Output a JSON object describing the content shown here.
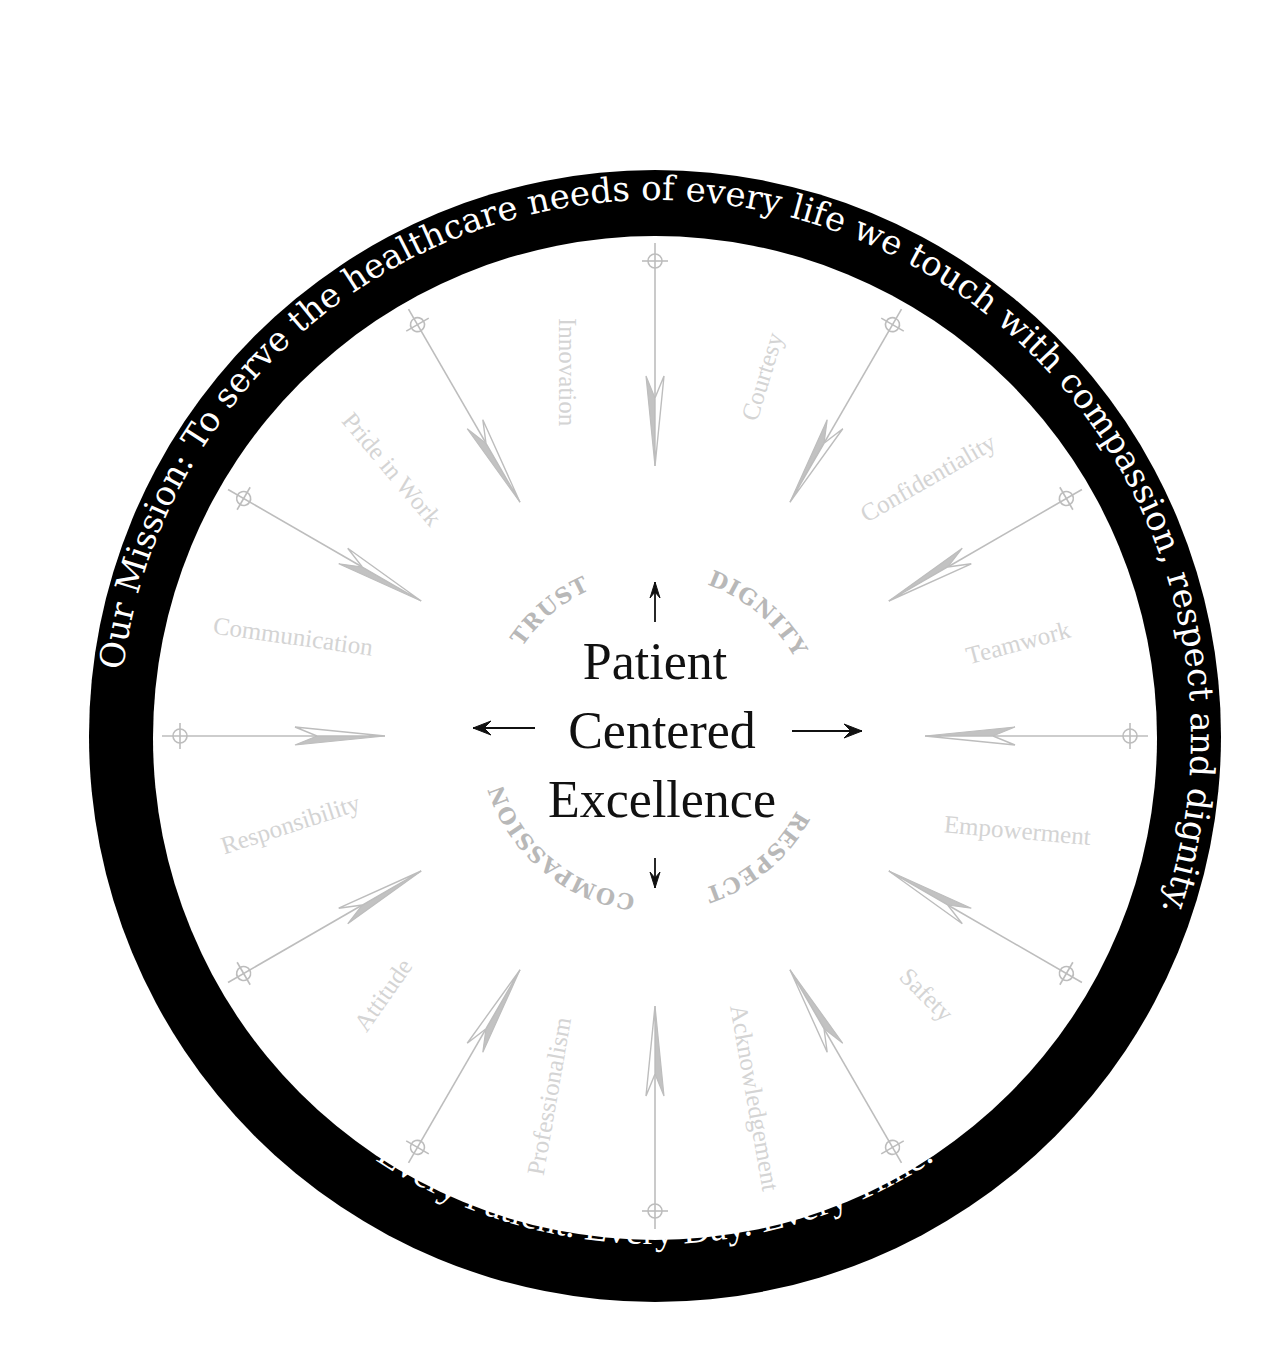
{
  "diagram": {
    "center": {
      "x": 655,
      "y": 736
    },
    "ring": {
      "outer_radius": 566,
      "inner_radius": 502,
      "color": "#000000",
      "mission_text": "Our Mission: To serve the healthcare needs of every life we touch with compassion, respect and dignity.",
      "motto_text": "Every Patient.   Every Day.   Every Time."
    },
    "center_title": {
      "lines": [
        "Patient",
        "Centered",
        "Excellence"
      ],
      "color": "#111111"
    },
    "core_values": [
      {
        "label": "TRUST",
        "angle": -40
      },
      {
        "label": "DIGNITY",
        "angle": 40
      },
      {
        "label": "RESPECT",
        "angle": 140
      },
      {
        "label": "COMPASSION",
        "angle": 220
      }
    ],
    "center_arrows": [
      "up",
      "right",
      "down",
      "left"
    ],
    "values": [
      {
        "label": "Innovation",
        "angle": -14
      },
      {
        "label": "Courtesy",
        "angle": 17
      },
      {
        "label": "Confidentiality",
        "angle": 47
      },
      {
        "label": "Teamwork",
        "angle": 76
      },
      {
        "label": "Empowerment",
        "angle": 105
      },
      {
        "label": "Safety",
        "angle": 134
      },
      {
        "label": "Acknowledgement",
        "angle": 165
      },
      {
        "label": "Professionalism",
        "angle": 196
      },
      {
        "label": "Attitude",
        "angle": 226
      },
      {
        "label": "Responsibility",
        "angle": 256
      },
      {
        "label": "Communication",
        "angle": 285
      },
      {
        "label": "Pride in Work",
        "angle": 315
      }
    ],
    "compass_arrows": {
      "angles": [
        0,
        30,
        60,
        90,
        120,
        150,
        180,
        210,
        240,
        270,
        300,
        330
      ],
      "tail_radius": 475,
      "tip_radius": 270,
      "color": "#bdbdbd"
    },
    "colors": {
      "ring": "#000000",
      "ring_text": "#ffffff",
      "value_text": "#d4d4d4",
      "core_text": "#b8b8b8",
      "arrow": "#bdbdbd",
      "title": "#111111"
    }
  }
}
